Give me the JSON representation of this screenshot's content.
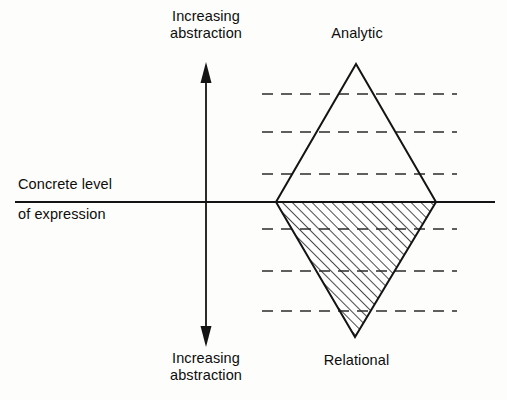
{
  "diagram": {
    "background_color": "#fdfdfb",
    "ink_color": "#141414",
    "labels": {
      "top_axis_label": "Increasing\nabstraction",
      "bottom_axis_label": "Increasing\nabstraction",
      "baseline_label_line1": "Concrete level",
      "baseline_label_line2": "of expression",
      "upper_region_label": "Analytic",
      "lower_region_label": "Relational"
    },
    "axes": {
      "vertical_arrow": {
        "name": "increasing-abstraction-axis",
        "x": 206,
        "top_y": 64,
        "bottom_y": 345,
        "arrowheads": "both",
        "color": "#141414"
      },
      "horizontal_baseline": {
        "name": "concrete-level-baseline",
        "y": 202,
        "x_start": 15,
        "x_end": 495,
        "color": "#141414"
      }
    },
    "shape": {
      "name": "double-triangle-diamond",
      "apex_top": {
        "x": 356,
        "y": 64
      },
      "vertex_left": {
        "x": 276,
        "y": 202
      },
      "vertex_right": {
        "x": 436,
        "y": 202
      },
      "apex_bottom": {
        "x": 355,
        "y": 337
      },
      "upper_fill": "none",
      "lower_fill": "diagonal-hatch",
      "hatch_angle_deg": 45,
      "stroke_color": "#141414"
    },
    "dashed_reference_lines": {
      "x_start": 262,
      "x_end": 457,
      "color": "#2b2b2b",
      "y_values": [
        94,
        132,
        174,
        229,
        271,
        311
      ]
    }
  }
}
